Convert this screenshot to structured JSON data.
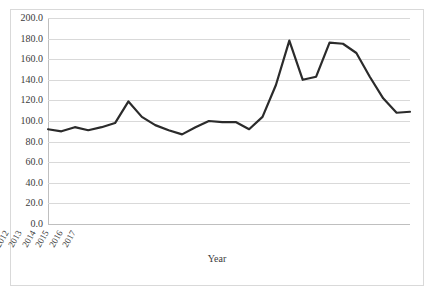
{
  "chart_data": {
    "type": "line",
    "title": "",
    "xlabel": "Year",
    "ylabel": "",
    "categories": [
      "1990",
      "1991",
      "1992",
      "1993",
      "1994",
      "1995",
      "1996",
      "1997",
      "1998",
      "1999",
      "2000",
      "2001",
      "2002",
      "2003",
      "2004",
      "2005",
      "2006",
      "2007",
      "2008",
      "2009",
      "2010",
      "2011",
      "2012",
      "2013",
      "2014",
      "2015",
      "2016",
      "2017"
    ],
    "values": [
      92.0,
      90.0,
      94.0,
      91.0,
      94.0,
      98.0,
      119.0,
      104.0,
      96.0,
      91.0,
      87.0,
      94.0,
      100.0,
      99.0,
      99.0,
      92.0,
      104.0,
      135.0,
      178.0,
      140.0,
      143.0,
      176.0,
      175.0,
      166.0,
      143.0,
      122.0,
      108.0,
      109.0
    ],
    "ylim": [
      0.0,
      200.0
    ],
    "ytick_labels": [
      "200.0",
      "180.0",
      "160.0",
      "140.0",
      "120.0",
      "100.0",
      "80.0",
      "60.0",
      "40.0",
      "20.0",
      "0.0"
    ],
    "ytick_values": [
      200,
      180,
      160,
      140,
      120,
      100,
      80,
      60,
      40,
      20,
      0
    ],
    "grid": "horizontal",
    "legend": "none",
    "series_color": "#2b2b2b",
    "gridline_color": "#d9d9d9",
    "border_color": "#d9d9d9",
    "text_color": "#3b3b3b"
  }
}
